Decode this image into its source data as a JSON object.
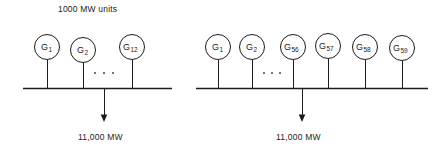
{
  "figure": {
    "title_annotation": "1000 MW units",
    "groups": [
      {
        "id": "left-group",
        "generators": [
          {
            "label": "G",
            "sub": "1"
          },
          {
            "label": "G",
            "sub": "2"
          },
          {
            "label": "G",
            "sub": "12"
          }
        ],
        "ellipsis": ". . .",
        "bus_output_label": "11,000 MW"
      },
      {
        "id": "right-group",
        "generators": [
          {
            "label": "G",
            "sub": "1"
          },
          {
            "label": "G",
            "sub": "2"
          },
          {
            "label": "G",
            "sub": "56"
          },
          {
            "label": "G",
            "sub": "57"
          },
          {
            "label": "G",
            "sub": "58"
          },
          {
            "label": "G",
            "sub": "59"
          }
        ],
        "ellipsis": ". . .",
        "bus_output_label": "11,000 MW"
      }
    ],
    "colors": {
      "stroke": "#1c1c1c",
      "background": "#ffffff",
      "dots": "#555555"
    }
  }
}
